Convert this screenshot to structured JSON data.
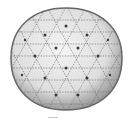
{
  "image": {
    "subject": "geodesic sphere mesh",
    "description": "Grayscale rendering of a triangulated geodesic sphere with dark vertex markers",
    "colors": {
      "background": "#ffffff",
      "sphere_fill_light": "#f2f2f2",
      "sphere_fill_dark": "#bdbdbd",
      "edge": "#555555",
      "vertex": "#3a3a3a"
    }
  }
}
